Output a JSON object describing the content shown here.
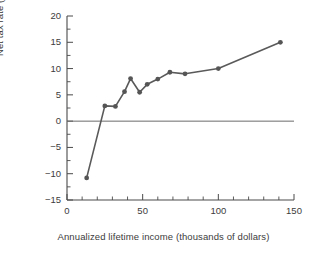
{
  "chart_data": {
    "type": "line",
    "title": "",
    "xlabel": "Annualized lifetime income (thousands of dollars)",
    "ylabel": "Net tax rate (percent)",
    "xlim": [
      0,
      150
    ],
    "ylim": [
      -15,
      20
    ],
    "grid": false,
    "legend": "none",
    "x_major_ticks": [
      0,
      50,
      100,
      150
    ],
    "x_major_tick_labels": [
      "0",
      "50",
      "100",
      "150"
    ],
    "x_minor_tick_step": 10,
    "y_major_ticks": [
      -15,
      -10,
      -5,
      0,
      5,
      10,
      15,
      20
    ],
    "y_major_tick_labels": [
      "−15",
      "−10",
      "−5",
      "0",
      "5",
      "10",
      "15",
      "20"
    ],
    "y_minor_tick_step": 2.5,
    "zero_reference_line": 0,
    "series": [
      {
        "name": "Net tax rate",
        "color": "#555555",
        "marker": "circle",
        "x": [
          13,
          25,
          32,
          38,
          42,
          48,
          53,
          60,
          68,
          78,
          100,
          141
        ],
        "y": [
          -10.8,
          2.9,
          2.8,
          5.6,
          8.1,
          5.5,
          7.0,
          8.0,
          9.3,
          9.0,
          10.0,
          15.0
        ]
      }
    ]
  },
  "colors": {
    "axis": "#4a4a4a",
    "series": "#555555",
    "zero_line": "#6b6b6b",
    "background": "#ffffff",
    "text": "#3c3c3c"
  }
}
